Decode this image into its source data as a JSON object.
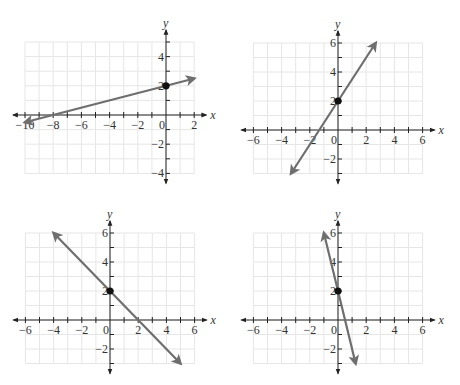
{
  "chart_data": [
    {
      "type": "line",
      "title": "Graph A",
      "xlabel": "x",
      "ylabel": "y",
      "xlim": [
        -10,
        2
      ],
      "ylim": [
        -4,
        5
      ],
      "x_ticks": [
        -10,
        -8,
        -6,
        -4,
        -2,
        0,
        2
      ],
      "y_ticks": [
        -4,
        -2,
        2,
        4
      ],
      "grid": true,
      "equation": "y = 0.25x + 2",
      "slope": 0.25,
      "intercept": 2,
      "segment": [
        [
          -10,
          -0.5
        ],
        [
          2,
          2.5
        ]
      ],
      "point": [
        0,
        2
      ],
      "frame": {
        "ox": 166,
        "oy": 115,
        "ux": 14.1,
        "uy": 14.6,
        "gx0": -10,
        "gx1": 2,
        "gy0": -4,
        "gy1": 5
      }
    },
    {
      "type": "line",
      "title": "Graph B",
      "xlabel": "x",
      "ylabel": "y",
      "xlim": [
        -6,
        6
      ],
      "ylim": [
        -3,
        6
      ],
      "x_ticks": [
        -6,
        -4,
        -2,
        0,
        2,
        4,
        6
      ],
      "y_ticks": [
        -2,
        2,
        4,
        6
      ],
      "grid": true,
      "equation": "y = 1.5x + 2",
      "slope": 1.5,
      "intercept": 2,
      "segment": [
        [
          -3.33,
          -3
        ],
        [
          2.67,
          6
        ]
      ],
      "point": [
        0,
        2
      ],
      "frame": {
        "ox": 338,
        "oy": 130,
        "ux": 14.1,
        "uy": 14.5,
        "gx0": -6,
        "gx1": 6,
        "gy0": -3,
        "gy1": 6
      }
    },
    {
      "type": "line",
      "title": "Graph C",
      "xlabel": "x",
      "ylabel": "y",
      "xlim": [
        -6,
        6
      ],
      "ylim": [
        -3,
        6
      ],
      "x_ticks": [
        -6,
        -4,
        -2,
        0,
        2,
        4,
        6
      ],
      "y_ticks": [
        -2,
        2,
        4,
        6
      ],
      "grid": true,
      "equation": "y = -x + 2",
      "slope": -1,
      "intercept": 2,
      "segment": [
        [
          -4,
          6
        ],
        [
          5,
          -3
        ]
      ],
      "point": [
        0,
        2
      ],
      "frame": {
        "ox": 110,
        "oy": 320,
        "ux": 14.1,
        "uy": 14.5,
        "gx0": -6,
        "gx1": 6,
        "gy0": -3,
        "gy1": 6
      }
    },
    {
      "type": "line",
      "title": "Graph D",
      "xlabel": "x",
      "ylabel": "y",
      "xlim": [
        -6,
        6
      ],
      "ylim": [
        -3,
        6
      ],
      "x_ticks": [
        -6,
        -4,
        -2,
        0,
        2,
        4,
        6
      ],
      "y_ticks": [
        -2,
        2,
        4,
        6
      ],
      "grid": true,
      "equation": "y = -4x + 2",
      "slope": -4,
      "intercept": 2,
      "segment": [
        [
          -1,
          6
        ],
        [
          1.25,
          -3
        ]
      ],
      "point": [
        0,
        2
      ],
      "frame": {
        "ox": 338,
        "oy": 320,
        "ux": 14.1,
        "uy": 14.5,
        "gx0": -6,
        "gx1": 6,
        "gy0": -3,
        "gy1": 6
      }
    }
  ],
  "colors": {
    "line": "#6e6e6e",
    "grid": "#e6e6e6",
    "axis": "#222222",
    "point": "#111111"
  }
}
